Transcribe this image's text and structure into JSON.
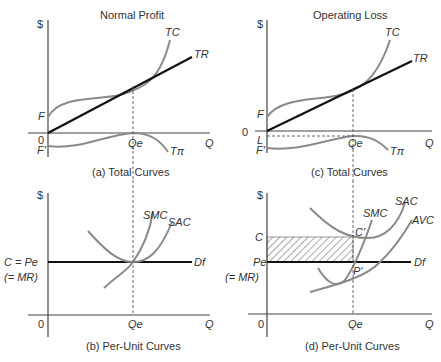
{
  "figure": {
    "column_titles": [
      "Normal Profit",
      "Operating Loss"
    ],
    "panels": {
      "a": {
        "caption": "(a) Total Curves",
        "ylabel": "$",
        "xlabel": "Q",
        "origin": "0",
        "labels": {
          "tc": "TC",
          "tr": "TR",
          "tpi": "Tπ",
          "f": "F",
          "fprime": "F'",
          "qe": "Qe"
        }
      },
      "b": {
        "caption": "(b) Per-Unit Curves",
        "ylabel": "$",
        "xlabel": "Q",
        "origin": "0",
        "labels": {
          "smc": "SMC",
          "sac": "SAC",
          "price": "C = Pe",
          "mr": "(= MR)",
          "demand": "Df",
          "qe": "Qe"
        }
      },
      "c": {
        "caption": "(c) Total Curves",
        "ylabel": "$",
        "xlabel": "Q",
        "origin": "0",
        "labels": {
          "tc": "TC",
          "tr": "TR",
          "tpi": "Tπ",
          "f": "F",
          "fprime": "F'",
          "l": "L",
          "qe": "Qe"
        }
      },
      "d": {
        "caption": "(d) Per-Unit Curves",
        "ylabel": "$",
        "xlabel": "Q",
        "origin": "0",
        "labels": {
          "smc": "SMC",
          "sac": "SAC",
          "avc": "AVC",
          "c": "C",
          "cprime": "C'",
          "pprime": "P'",
          "price": "Pe",
          "mr": "(= MR)",
          "demand": "Df",
          "qe": "Qe"
        }
      }
    }
  }
}
